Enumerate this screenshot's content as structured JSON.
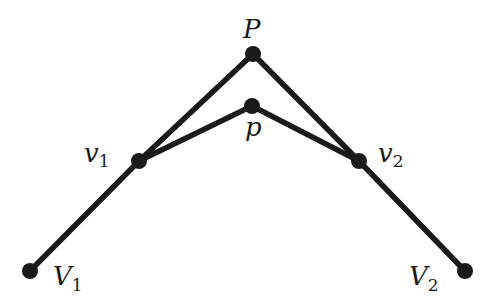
{
  "diagram": {
    "type": "geometric-construction",
    "points": [
      {
        "id": "V1",
        "label": "V",
        "subscript": "1"
      },
      {
        "id": "v1",
        "label": "v",
        "subscript": "1"
      },
      {
        "id": "P",
        "label": "P",
        "subscript": ""
      },
      {
        "id": "p",
        "label": "p",
        "subscript": ""
      },
      {
        "id": "v2",
        "label": "v",
        "subscript": "2"
      },
      {
        "id": "V2",
        "label": "V",
        "subscript": "2"
      }
    ],
    "edges": [
      {
        "from": "V1",
        "to": "v1"
      },
      {
        "from": "v1",
        "to": "P"
      },
      {
        "from": "P",
        "to": "v2"
      },
      {
        "from": "v2",
        "to": "V2"
      },
      {
        "from": "v1",
        "to": "p"
      },
      {
        "from": "p",
        "to": "v2"
      }
    ],
    "colors": {
      "ink": "#1a1a1a",
      "background": "#ffffff"
    }
  }
}
